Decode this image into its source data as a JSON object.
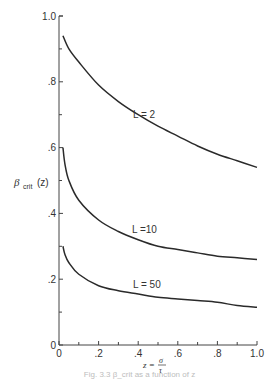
{
  "chart_data": {
    "type": "line",
    "title": "",
    "xlabel": "z = σ/τ",
    "ylabel": "β_crit (z)",
    "xlim": [
      0,
      1.0
    ],
    "ylim": [
      0,
      1.0
    ],
    "grid": false,
    "x_ticks": [
      "0",
      ".2",
      ".4",
      ".6",
      ".8",
      "1.0"
    ],
    "y_ticks": [
      "0",
      ".2",
      ".4",
      ".6",
      ".8",
      "1.0"
    ],
    "series": [
      {
        "name": "L=2",
        "x": [
          0.02,
          0.05,
          0.1,
          0.2,
          0.3,
          0.4,
          0.5,
          0.6,
          0.7,
          0.8,
          0.9,
          1.0
        ],
        "values": [
          0.94,
          0.9,
          0.86,
          0.79,
          0.74,
          0.7,
          0.665,
          0.635,
          0.605,
          0.58,
          0.56,
          0.54
        ]
      },
      {
        "name": "L=10",
        "x": [
          0.02,
          0.03,
          0.05,
          0.1,
          0.2,
          0.3,
          0.4,
          0.5,
          0.6,
          0.7,
          0.8,
          0.9,
          1.0
        ],
        "values": [
          0.6,
          0.55,
          0.5,
          0.44,
          0.38,
          0.345,
          0.32,
          0.3,
          0.29,
          0.28,
          0.27,
          0.265,
          0.26
        ]
      },
      {
        "name": "L=50",
        "x": [
          0.02,
          0.03,
          0.05,
          0.1,
          0.2,
          0.3,
          0.4,
          0.5,
          0.6,
          0.7,
          0.8,
          0.9,
          1.0
        ],
        "values": [
          0.3,
          0.275,
          0.25,
          0.215,
          0.18,
          0.165,
          0.155,
          0.145,
          0.14,
          0.135,
          0.13,
          0.12,
          0.115
        ]
      }
    ],
    "annotations": [
      {
        "text": "L=2",
        "x": 0.38,
        "y": 0.73
      },
      {
        "text": "L=10",
        "x": 0.38,
        "y": 0.365
      },
      {
        "text": "L=50",
        "x": 0.38,
        "y": 0.17
      }
    ]
  },
  "labels": {
    "ylabel_main": "β",
    "ylabel_sub": "crit",
    "ylabel_arg": "(z)",
    "xlabel_lhs": "z =",
    "xlabel_num": "σ",
    "xlabel_den": "τ",
    "curve_L2": "L = 2",
    "curve_L10": "L =10",
    "curve_L50": "L = 50",
    "caption": "Fig. 3.3  β_crit as a function of z"
  }
}
